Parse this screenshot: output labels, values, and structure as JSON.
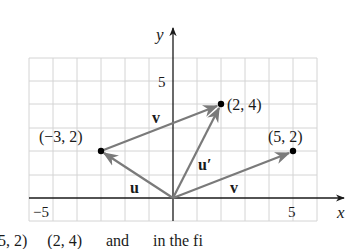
{
  "diagram": {
    "axes": {
      "x_label": "x",
      "y_label": "y",
      "x_ticks": [
        {
          "value": -5,
          "label": "−5"
        },
        {
          "value": 5,
          "label": "5"
        }
      ],
      "y_ticks": [
        {
          "value": 5,
          "label": "5"
        }
      ],
      "x_range": [
        -6,
        6
      ],
      "y_range": [
        -1,
        6
      ]
    },
    "points": [
      {
        "id": "p1",
        "x": -3,
        "y": 2,
        "label": "(−3, 2)"
      },
      {
        "id": "p2",
        "x": 2,
        "y": 4,
        "label": "(2, 4)"
      },
      {
        "id": "p3",
        "x": 5,
        "y": 2,
        "label": "(5, 2)"
      }
    ],
    "vectors": [
      {
        "name": "u",
        "from": [
          0,
          0
        ],
        "to": [
          -3,
          2
        ],
        "label": "u"
      },
      {
        "name": "v_top",
        "from": [
          -3,
          2
        ],
        "to": [
          2,
          4
        ],
        "label": "v"
      },
      {
        "name": "u_prime",
        "from": [
          0,
          0
        ],
        "to": [
          2,
          4
        ],
        "label": "u′"
      },
      {
        "name": "v_bottom",
        "from": [
          0,
          0
        ],
        "to": [
          5,
          2
        ],
        "label": "v"
      }
    ],
    "colors": {
      "vector": "#7a7a7a",
      "grid": "#d4d4d4",
      "axis": "#1a1a1a",
      "point": "#000000"
    }
  },
  "caption": {
    "text": "5, 2)     (2, 4)      and      in the fi"
  }
}
